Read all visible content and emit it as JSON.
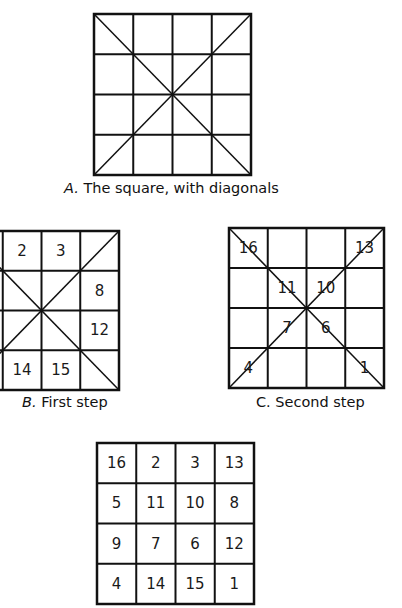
{
  "figure": {
    "panel_a": {
      "caption_letter": "A.",
      "caption_text": " The square, with diagonals",
      "cells": [
        "",
        "",
        "",
        "",
        "",
        "",
        "",
        "",
        "",
        "",
        "",
        "",
        "",
        "",
        "",
        ""
      ]
    },
    "panel_b": {
      "caption_letter": "B.",
      "caption_text": " First step",
      "cells": [
        "",
        "2",
        "3",
        "",
        "",
        "",
        "",
        "8",
        "",
        "",
        "",
        "12",
        "",
        "14",
        "15",
        ""
      ]
    },
    "panel_c": {
      "caption_letter": "C.",
      "caption_text": " Second step",
      "cells": [
        "16",
        "",
        "",
        "13",
        "",
        "11",
        "10",
        "",
        "",
        "7",
        "6",
        "",
        "4",
        "",
        "",
        "1"
      ]
    },
    "panel_d": {
      "cells": [
        "16",
        "2",
        "3",
        "13",
        "5",
        "11",
        "10",
        "8",
        "9",
        "7",
        "6",
        "12",
        "4",
        "14",
        "15",
        "1"
      ]
    }
  }
}
